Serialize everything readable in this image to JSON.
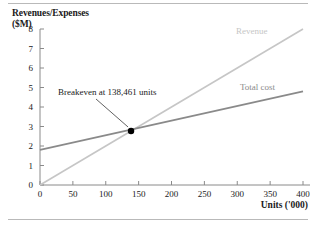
{
  "figure": {
    "y_axis_title": "Revenues/Expenses\n($M)",
    "x_axis_title": "Units ('000)"
  },
  "chart_data": {
    "type": "line",
    "title": "",
    "subtitle": "",
    "xlabel": "Units ('000)",
    "ylabel": "Revenues/Expenses ($M)",
    "xlim": [
      0,
      400
    ],
    "ylim": [
      0,
      8
    ],
    "xticks": [
      0,
      50,
      100,
      150,
      200,
      250,
      300,
      350,
      400
    ],
    "yticks": [
      0,
      1,
      2,
      3,
      4,
      5,
      6,
      7,
      8
    ],
    "xtick_labels": [
      "0",
      "50",
      "100",
      "150",
      "200",
      "250",
      "300",
      "350",
      "400"
    ],
    "ytick_labels": [
      "0",
      "1",
      "2",
      "3",
      "4",
      "5",
      "6",
      "7",
      "8"
    ],
    "grid": false,
    "legend_position": "inline-right",
    "series": [
      {
        "name": "Revenue",
        "label": "Revenue",
        "color": "#c6c6c6",
        "x": [
          0,
          400
        ],
        "values": [
          0,
          8.0
        ]
      },
      {
        "name": "Total cost",
        "label": "Total cost",
        "color": "#8a8a8a",
        "x": [
          0,
          400
        ],
        "values": [
          1.8,
          4.8
        ]
      }
    ],
    "annotations": [
      {
        "text": "Breakeven at 138,461 units",
        "point_x": 138.461,
        "point_y": 2.77,
        "marker": "filled-circle",
        "marker_color": "#000000"
      }
    ]
  }
}
